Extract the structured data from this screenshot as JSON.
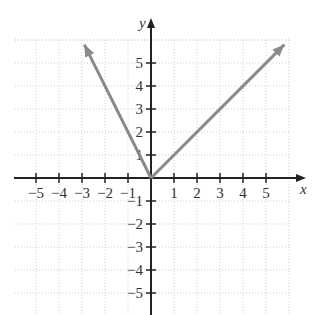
{
  "chart_data": {
    "type": "line",
    "title": "",
    "xlabel": "x",
    "ylabel": "y",
    "xlim": [
      -6,
      6
    ],
    "ylim": [
      -6,
      6
    ],
    "grid": true,
    "x_ticks": [
      -5,
      -4,
      -3,
      -2,
      -1,
      1,
      2,
      3,
      4,
      5
    ],
    "y_ticks": [
      5,
      4,
      3,
      2,
      1,
      -1,
      -2,
      -3,
      -4,
      -5
    ],
    "x_tick_labels": [
      "−5",
      "−4",
      "−3",
      "−2",
      "−1",
      "1",
      "2",
      "3",
      "4",
      "5"
    ],
    "y_tick_labels": [
      "5",
      "4",
      "3",
      "2",
      "1",
      "−1",
      "−2",
      "−3",
      "−4",
      "−5"
    ],
    "series": [
      {
        "name": "left ray (y = -2x, x ≤ 0)",
        "x": [
          0,
          -2.9
        ],
        "y": [
          0,
          5.8
        ],
        "color": "#8a8a8a",
        "arrow_end": true
      },
      {
        "name": "right ray (y = x, x ≥ 0)",
        "x": [
          0,
          5.8
        ],
        "y": [
          0,
          5.8
        ],
        "color": "#8a8a8a",
        "arrow_end": true
      }
    ]
  },
  "labels": {
    "x_axis": "x",
    "y_axis": "y"
  }
}
